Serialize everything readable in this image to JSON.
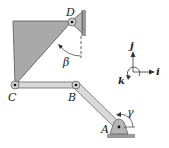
{
  "diagram": {
    "type": "planar linkage mechanism",
    "points": {
      "A": "A",
      "B": "B",
      "C": "C",
      "D": "D"
    },
    "angles": {
      "beta": "β",
      "gamma": "γ"
    },
    "axes": {
      "i": "i",
      "j": "j",
      "k": "k"
    },
    "members": [
      "triangular plate CD",
      "link CB",
      "link BA"
    ],
    "colors": {
      "plate": "#a9a9a9",
      "link": "#d9d9d9",
      "support": "#b5b5b5",
      "outline": "#444444"
    }
  }
}
